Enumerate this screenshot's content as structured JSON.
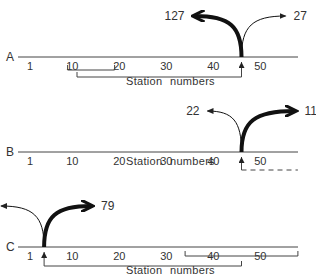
{
  "figure": {
    "panels": [
      {
        "label": "A",
        "origin_station": 46,
        "flows": [
          {
            "direction": "left",
            "weight": "thick",
            "value": "127"
          },
          {
            "direction": "right",
            "weight": "thin",
            "value": "27"
          }
        ],
        "brackets": [
          {
            "from_station": 9,
            "to_station": 19,
            "style": "solid"
          },
          {
            "from_station": 11,
            "to_station": 46,
            "style": "solid",
            "arrow_end": true
          }
        ]
      },
      {
        "label": "B",
        "origin_station": 46,
        "flows": [
          {
            "direction": "left",
            "weight": "thin",
            "value": "22"
          },
          {
            "direction": "right",
            "weight": "thick",
            "value": "119"
          }
        ],
        "brackets": [
          {
            "from_station": 46,
            "to_station": 58,
            "style": "dashed",
            "arrow_start": true
          }
        ]
      },
      {
        "label": "C",
        "origin_station": 4,
        "flows": [
          {
            "direction": "left",
            "weight": "thin",
            "value": "7"
          },
          {
            "direction": "right",
            "weight": "thick",
            "value": "79"
          }
        ],
        "brackets": [
          {
            "from_station": 34,
            "to_station": 58,
            "style": "solid"
          },
          {
            "from_station": 4,
            "to_station": 46,
            "style": "solid",
            "arrow_start": true
          }
        ]
      }
    ],
    "tick_labels": [
      "1",
      "10",
      "20",
      "30",
      "40",
      "50"
    ],
    "tick_stations": [
      1,
      10,
      20,
      30,
      40,
      50
    ],
    "axis_caption_station": "Station",
    "axis_caption_numbers": "numbers"
  }
}
